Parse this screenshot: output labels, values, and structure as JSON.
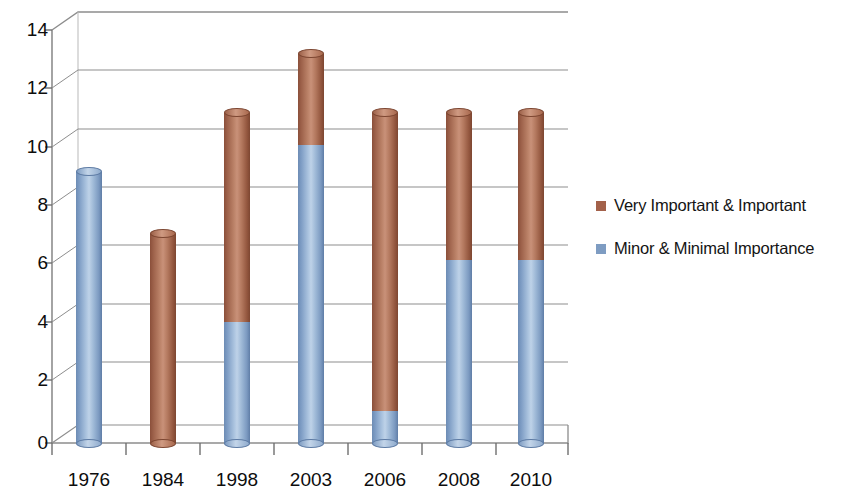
{
  "chart_data": {
    "type": "bar",
    "subtype": "stacked-column-3d-cylinder",
    "title": "",
    "xlabel": "",
    "ylabel": "",
    "categories": [
      "1976",
      "1984",
      "1998",
      "2003",
      "2006",
      "2008",
      "2010"
    ],
    "series": [
      {
        "name": "Very Important & Important",
        "color": "#a3614a",
        "values": [
          0,
          7.1,
          7.1,
          3.1,
          10.1,
          5.0,
          5.0
        ]
      },
      {
        "name": "Minor & Minimal Importance",
        "color": "#7e9cc2",
        "values": [
          9.2,
          0,
          4.1,
          10.1,
          1.1,
          6.2,
          6.2
        ]
      }
    ],
    "totals": [
      9.2,
      7.1,
      11.2,
      13.2,
      11.2,
      11.2,
      11.2
    ],
    "ylim": [
      0,
      14
    ],
    "yticks": [
      0,
      2,
      4,
      6,
      8,
      10,
      12,
      14
    ],
    "ytick_labels": [
      "0",
      "2",
      "4",
      "6",
      "8",
      "10",
      "12",
      "14"
    ],
    "grid": true,
    "legend_position": "right"
  },
  "legend": {
    "items": [
      {
        "label": "Very Important & Important",
        "color": "#a3614a"
      },
      {
        "label": "Minor & Minimal Importance",
        "color": "#7e9cc2"
      }
    ]
  }
}
